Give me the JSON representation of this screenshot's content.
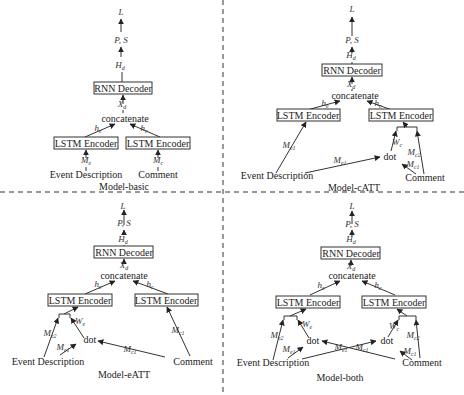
{
  "figure": {
    "dividers": {
      "vertical_x": 223,
      "horizontal_y": 192
    },
    "common": {
      "output": "L",
      "ps": "P, S",
      "hd": "H",
      "hd_sub": "d",
      "decoder": "RNN Decoder",
      "xd": "X",
      "xd_sub": "d",
      "concat": "concatenate",
      "encoder": "LSTM Encoder",
      "he": "h",
      "he_sub": "e",
      "hc": "h",
      "hc_sub": "c",
      "dot": "dot",
      "event": "Event Description",
      "comment": "Comment"
    },
    "panels": [
      {
        "id": "basic",
        "caption": "Model-basic",
        "inputs": {
          "me": "M",
          "me_sub": "e",
          "mc": "M",
          "mc_sub": "c"
        }
      },
      {
        "id": "catt",
        "caption": "Model-cATT",
        "inputs": {
          "me1": "M",
          "me1_sub": "e1",
          "mc1": "M",
          "mc1_sub": "c1",
          "mc2": "M",
          "mc2_sub": "c2",
          "wc": "W",
          "wc_sub": "c"
        }
      },
      {
        "id": "eatt",
        "caption": "Model-eATT",
        "inputs": {
          "me1": "M",
          "me1_sub": "e1",
          "me2": "M",
          "me2_sub": "e2",
          "mc1": "M",
          "mc1_sub": "c1",
          "we": "W",
          "we_sub": "e"
        }
      },
      {
        "id": "both",
        "caption": "Model-both",
        "inputs": {
          "me1": "M",
          "me1_sub": "e1",
          "me2": "M",
          "me2_sub": "e2",
          "mc1": "M",
          "mc1_sub": "c1",
          "mc2": "M",
          "mc2_sub": "c2",
          "we": "W",
          "we_sub": "e",
          "wc": "W",
          "wc_sub": "c"
        }
      }
    ]
  }
}
